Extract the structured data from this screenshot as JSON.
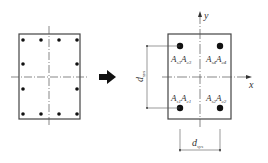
{
  "left_section": {
    "description": "rectangular column cross-section with 12 reinforcement bars",
    "bars_count": 12
  },
  "arrow": {
    "direction": "right"
  },
  "right_section": {
    "axis_x_label": "x",
    "axis_y_label": "y",
    "quadrants": [
      {
        "id": "top-left",
        "label_s": "A",
        "sub_s": "s3",
        "label_c": "A",
        "sub_c": "c3"
      },
      {
        "id": "top-right",
        "label_s": "A",
        "sub_s": "s4",
        "label_c": "A",
        "sub_c": "c4"
      },
      {
        "id": "bottom-left",
        "label_s": "A",
        "sub_s": "s1",
        "label_c": "A",
        "sub_c": "c1"
      },
      {
        "id": "bottom-right",
        "label_s": "A",
        "sub_s": "s2",
        "label_c": "A",
        "sub_c": "c2"
      }
    ],
    "dim_vertical": {
      "label": "d",
      "sub": "sys"
    },
    "dim_horizontal": {
      "label": "d",
      "sub": "sys"
    }
  },
  "colors": {
    "stroke": "#333333",
    "bar": "#111111"
  }
}
